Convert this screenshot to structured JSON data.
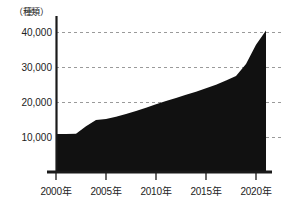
{
  "chart_data": {
    "type": "area",
    "title": "",
    "subtitle": "",
    "xlabel": "",
    "ylabel": "",
    "unit_label": "（種類）",
    "grid": true,
    "grid_axis": "y",
    "legend": "none",
    "xlim": [
      2000,
      2021
    ],
    "ylim": [
      0,
      42000
    ],
    "y_ticks": [
      10000,
      20000,
      30000,
      40000
    ],
    "y_tick_labels": [
      "10,000",
      "20,000",
      "30,000",
      "40,000"
    ],
    "x_ticks": [
      2000,
      2005,
      2010,
      2015,
      2020
    ],
    "x_tick_labels": [
      "2000年",
      "2005年",
      "2010年",
      "2015年",
      "2020年"
    ],
    "series_name": "種類数",
    "x": [
      2000,
      2001,
      2002,
      2003,
      2004,
      2005,
      2006,
      2007,
      2008,
      2009,
      2010,
      2011,
      2012,
      2013,
      2014,
      2015,
      2016,
      2017,
      2018,
      2019,
      2020,
      2021
    ],
    "values": [
      11000,
      11000,
      11100,
      13200,
      15000,
      15300,
      15900,
      16700,
      17600,
      18500,
      19500,
      20400,
      21300,
      22200,
      23100,
      24100,
      25100,
      26300,
      27600,
      31000,
      36500,
      40600
    ],
    "colors": {
      "area_fill": "#111111",
      "axis_line": "#1a1a1a",
      "grid_line": "#9a9a9a",
      "text": "#222222",
      "background": "#ffffff"
    }
  },
  "axes": {
    "unit": "（種類）",
    "y_labels": [
      "40,000",
      "30,000",
      "20,000",
      "10,000"
    ],
    "x_labels": [
      "2000年",
      "2005年",
      "2010年",
      "2015年",
      "2020年"
    ]
  }
}
